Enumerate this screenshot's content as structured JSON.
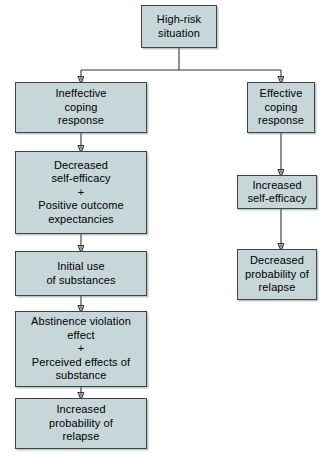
{
  "diagram": {
    "type": "flowchart",
    "orientation": "top-down",
    "colors": {
      "node_fill": "#c6d6d9",
      "node_border": "#3c4547",
      "edge": "#2f3638",
      "text": "#000000",
      "background": "#ffffff"
    },
    "nodes": [
      {
        "id": "high-risk-situation",
        "label": "High-risk\nsituation",
        "branch": "root",
        "x": 141,
        "y": 5,
        "w": 76,
        "h": 43
      },
      {
        "id": "ineffective-coping-response",
        "label": "Ineffective\ncoping\nresponse",
        "branch": "left",
        "x": 15,
        "y": 82,
        "w": 132,
        "h": 51
      },
      {
        "id": "decreased-self-efficacy-positive-outcome-expectancies",
        "label": "Decreased\nself-efficacy\n+\nPositive outcome\nexpectancies",
        "branch": "left",
        "x": 15,
        "y": 151,
        "w": 132,
        "h": 83
      },
      {
        "id": "initial-use-of-substances",
        "label": "Initial use\nof substances",
        "branch": "left",
        "x": 15,
        "y": 251,
        "w": 132,
        "h": 45
      },
      {
        "id": "abstinence-violation-effect-perceived-effects-of-substance",
        "label": "Abstinence violation\neffect\n+\nPerceived effects of\nsubstance",
        "branch": "left",
        "x": 15,
        "y": 311,
        "w": 132,
        "h": 76
      },
      {
        "id": "increased-probability-of-relapse",
        "label": "Increased\nprobability of\nrelapse",
        "branch": "left",
        "x": 15,
        "y": 398,
        "w": 132,
        "h": 51
      },
      {
        "id": "effective-coping-response",
        "label": "Effective\ncoping\nresponse",
        "branch": "right",
        "x": 247,
        "y": 82,
        "w": 68,
        "h": 51
      },
      {
        "id": "increased-self-efficacy",
        "label": "Increased\nself-efficacy",
        "branch": "right",
        "x": 237,
        "y": 175,
        "w": 80,
        "h": 34
      },
      {
        "id": "decreased-probability-of-relapse",
        "label": "Decreased\nprobability of\nrelapse",
        "branch": "right",
        "x": 237,
        "y": 249,
        "w": 80,
        "h": 51
      }
    ],
    "edges": [
      {
        "id": "edge-root-split",
        "from": "high-risk-situation",
        "to": "branch-split",
        "style": "elbow"
      },
      {
        "id": "edge-split-ineffective",
        "from": "branch-split",
        "to": "ineffective-coping-response",
        "style": "arrow"
      },
      {
        "id": "edge-split-effective",
        "from": "branch-split",
        "to": "effective-coping-response",
        "style": "arrow"
      },
      {
        "id": "edge-ineffective-decreased",
        "from": "ineffective-coping-response",
        "to": "decreased-self-efficacy-positive-outcome-expectancies",
        "style": "arrow"
      },
      {
        "id": "edge-decreased-initial-use",
        "from": "decreased-self-efficacy-positive-outcome-expectancies",
        "to": "initial-use-of-substances",
        "style": "arrow"
      },
      {
        "id": "edge-initial-use-ave",
        "from": "initial-use-of-substances",
        "to": "abstinence-violation-effect-perceived-effects-of-substance",
        "style": "arrow"
      },
      {
        "id": "edge-ave-increased-relapse",
        "from": "abstinence-violation-effect-perceived-effects-of-substance",
        "to": "increased-probability-of-relapse",
        "style": "arrow"
      },
      {
        "id": "edge-effective-increased-efficacy",
        "from": "effective-coping-response",
        "to": "increased-self-efficacy",
        "style": "arrow"
      },
      {
        "id": "edge-increased-efficacy-decreased-relapse",
        "from": "increased-self-efficacy",
        "to": "decreased-probability-of-relapse",
        "style": "arrow"
      }
    ]
  }
}
